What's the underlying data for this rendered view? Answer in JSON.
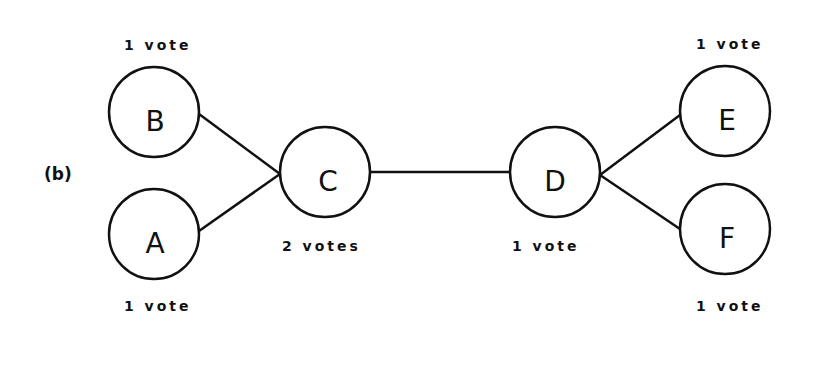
{
  "panel_label": "(b)",
  "colors": {
    "stroke": "#111111",
    "background": "#ffffff"
  },
  "nodes": [
    {
      "id": "B",
      "label": "B",
      "votes": "1 vote",
      "vote_position": "above"
    },
    {
      "id": "A",
      "label": "A",
      "votes": "1 vote",
      "vote_position": "below"
    },
    {
      "id": "C",
      "label": "C",
      "votes": "2 votes",
      "vote_position": "below"
    },
    {
      "id": "D",
      "label": "D",
      "votes": "1 vote",
      "vote_position": "below"
    },
    {
      "id": "E",
      "label": "E",
      "votes": "1 vote",
      "vote_position": "above"
    },
    {
      "id": "F",
      "label": "F",
      "votes": "1 vote",
      "vote_position": "below"
    }
  ],
  "edges": [
    {
      "from": "B",
      "to": "C"
    },
    {
      "from": "A",
      "to": "C"
    },
    {
      "from": "C",
      "to": "D"
    },
    {
      "from": "D",
      "to": "E"
    },
    {
      "from": "D",
      "to": "F"
    }
  ]
}
